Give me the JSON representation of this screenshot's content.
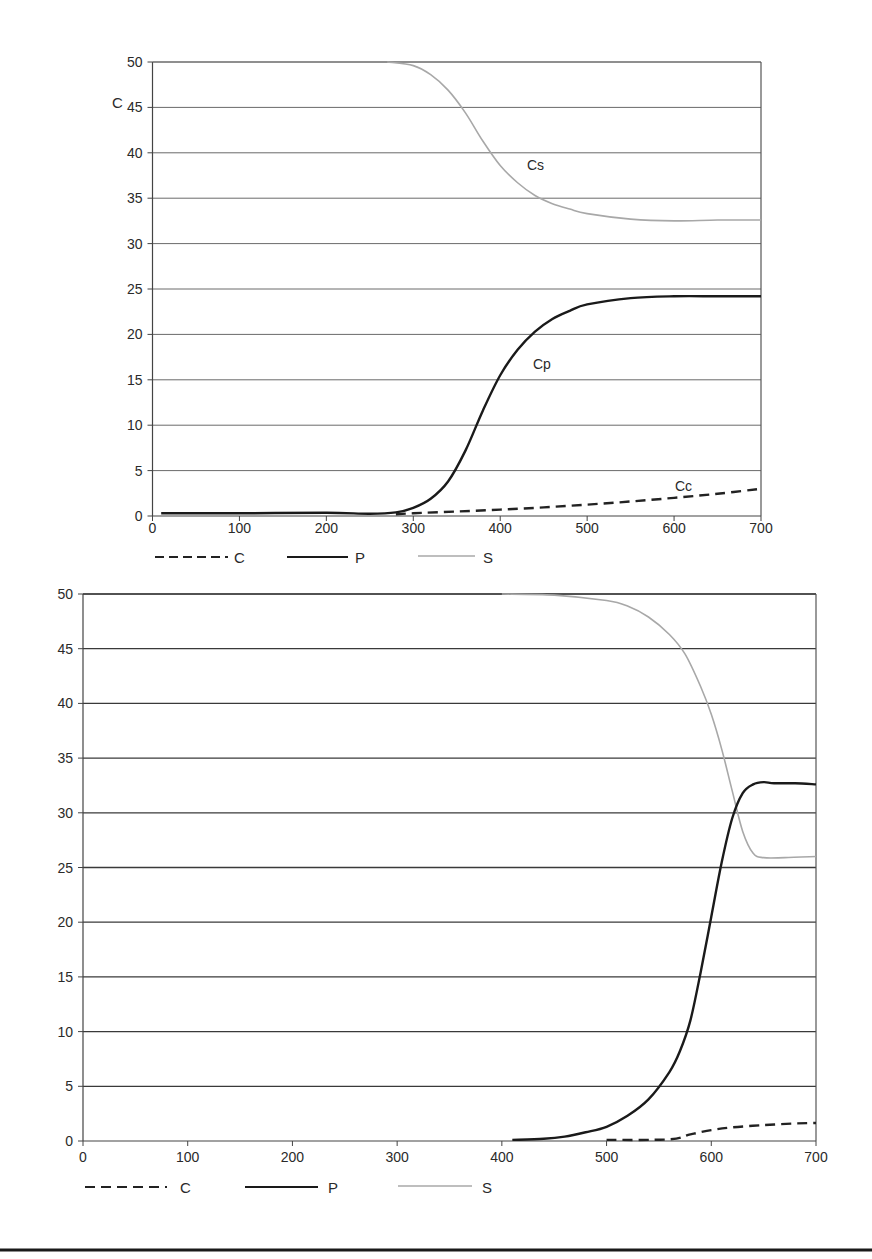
{
  "chart_data": [
    {
      "type": "line",
      "title": "",
      "xlabel": "",
      "ylabel": "C",
      "xlim": [
        0,
        700
      ],
      "ylim": [
        0,
        50
      ],
      "x_ticks": [
        0,
        100,
        200,
        300,
        400,
        500,
        600,
        700
      ],
      "y_ticks": [
        0,
        5,
        10,
        15,
        20,
        25,
        30,
        35,
        40,
        45,
        50
      ],
      "grid": {
        "horizontal": true,
        "vertical": false
      },
      "legend": {
        "position": "bottom",
        "entries": [
          "C",
          "P",
          "S"
        ]
      },
      "annotations": [
        {
          "text": "Cs",
          "x": 415,
          "y": 38.8
        },
        {
          "text": "Cp",
          "x": 420,
          "y": 17.3
        },
        {
          "text": "Cc",
          "x": 630,
          "y": 3.3
        }
      ],
      "series": [
        {
          "name": "C",
          "style": "dashed",
          "color": "#222222",
          "x": [
            280,
            300,
            350,
            400,
            450,
            500,
            550,
            600,
            650,
            700
          ],
          "y": [
            0.2,
            0.3,
            0.5,
            0.7,
            0.95,
            1.25,
            1.6,
            2.0,
            2.45,
            3.0
          ]
        },
        {
          "name": "P",
          "style": "solid",
          "color": "#1a1a1a",
          "x": [
            10,
            100,
            200,
            250,
            280,
            300,
            320,
            340,
            360,
            380,
            400,
            420,
            440,
            460,
            480,
            500,
            550,
            600,
            650,
            700
          ],
          "y": [
            0.3,
            0.3,
            0.35,
            0.25,
            0.4,
            0.9,
            1.9,
            3.8,
            7.2,
            11.6,
            15.5,
            18.3,
            20.3,
            21.7,
            22.6,
            23.3,
            24.0,
            24.2,
            24.2,
            24.2
          ]
        },
        {
          "name": "S",
          "style": "solid",
          "color": "#a8a8a8",
          "x": [
            270,
            300,
            320,
            340,
            360,
            380,
            400,
            420,
            440,
            460,
            480,
            500,
            550,
            600,
            650,
            700
          ],
          "y": [
            50.0,
            49.6,
            48.6,
            46.9,
            44.4,
            41.3,
            38.6,
            36.7,
            35.3,
            34.4,
            33.8,
            33.3,
            32.7,
            32.5,
            32.6,
            32.6
          ]
        }
      ]
    },
    {
      "type": "line",
      "title": "",
      "xlabel": "",
      "ylabel": "",
      "xlim": [
        0,
        700
      ],
      "ylim": [
        0,
        50
      ],
      "x_ticks": [
        0,
        100,
        200,
        300,
        400,
        500,
        600,
        700
      ],
      "y_ticks": [
        0,
        5,
        10,
        15,
        20,
        25,
        30,
        35,
        40,
        45,
        50
      ],
      "grid": {
        "horizontal": true,
        "vertical": false
      },
      "legend": {
        "position": "bottom",
        "entries": [
          "C",
          "P",
          "S"
        ]
      },
      "series": [
        {
          "name": "C",
          "style": "dashed",
          "color": "#222222",
          "x": [
            500,
            560,
            580,
            600,
            620,
            650,
            680,
            700
          ],
          "y": [
            0.1,
            0.15,
            0.6,
            1.0,
            1.25,
            1.45,
            1.6,
            1.65
          ]
        },
        {
          "name": "P",
          "style": "solid",
          "color": "#1a1a1a",
          "x": [
            410,
            440,
            460,
            480,
            500,
            520,
            540,
            560,
            570,
            580,
            590,
            600,
            610,
            620,
            630,
            640,
            650,
            660,
            680,
            700
          ],
          "y": [
            0.1,
            0.2,
            0.4,
            0.8,
            1.3,
            2.3,
            3.8,
            6.3,
            8.2,
            11.0,
            15.5,
            20.5,
            25.5,
            29.5,
            31.8,
            32.6,
            32.8,
            32.7,
            32.7,
            32.6
          ]
        },
        {
          "name": "S",
          "style": "solid",
          "color": "#a8a8a8",
          "x": [
            400,
            450,
            500,
            520,
            540,
            560,
            575,
            590,
            600,
            610,
            620,
            630,
            640,
            650,
            670,
            700
          ],
          "y": [
            50.0,
            49.9,
            49.4,
            48.9,
            47.9,
            46.3,
            44.5,
            41.5,
            39.0,
            35.8,
            32.0,
            28.3,
            26.3,
            25.9,
            25.9,
            26.0
          ]
        }
      ]
    }
  ],
  "charts": [
    {
      "ylabel": "C",
      "annotations": {
        "cs": "Cs",
        "cp": "Cp",
        "cc": "Cc"
      },
      "legend": {
        "c": "C",
        "p": "P",
        "s": "S"
      }
    },
    {
      "legend": {
        "c": "C",
        "p": "P",
        "s": "S"
      }
    }
  ]
}
